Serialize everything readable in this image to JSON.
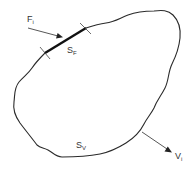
{
  "diagram": {
    "colors": {
      "background": "#ffffff",
      "outline": "#2a2a2a",
      "force_surface": "#111111",
      "arrows": "#444444",
      "text": "#333333"
    },
    "labels": {
      "force": {
        "main": "F",
        "sub": "i"
      },
      "force_surface": {
        "main": "S",
        "sub": "F"
      },
      "velocity_surface": {
        "main": "S",
        "sub": "V"
      },
      "velocity": {
        "main": "V",
        "sub": "i"
      }
    },
    "arrows": [
      {
        "name": "force-arrow",
        "from": [
          28,
          28
        ],
        "to": [
          62,
          37
        ]
      },
      {
        "name": "velocity-arrow",
        "from": [
          142,
          132
        ],
        "to": [
          172,
          152
        ]
      }
    ],
    "force_surface_segment": {
      "from": [
        45,
        53
      ],
      "to": [
        86,
        28
      ]
    }
  }
}
